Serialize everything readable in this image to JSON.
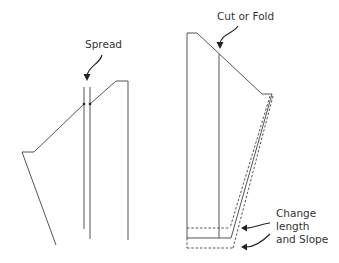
{
  "diagram": {
    "type": "pattern-alteration",
    "labels": {
      "spread": "Spread",
      "cut_or_fold": "Cut or Fold",
      "change_line1": "Change",
      "change_line2": "length",
      "change_line3": "and Slope"
    },
    "colors": {
      "line": "#555555",
      "text": "#333333",
      "background": "#ffffff"
    }
  }
}
